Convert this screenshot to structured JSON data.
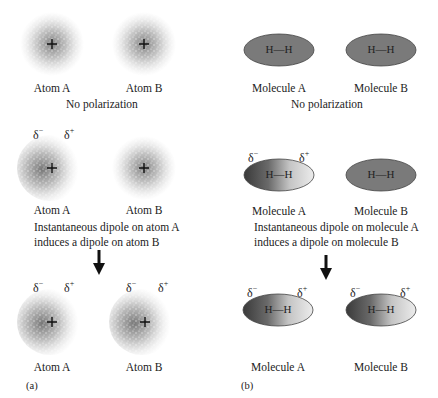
{
  "panel_a": {
    "tag": "(a)",
    "rows": [
      {
        "atoms": [
          {
            "label": "Atom A",
            "polarized": false
          },
          {
            "label": "Atom B",
            "polarized": false
          }
        ],
        "caption": "No polarization"
      },
      {
        "atoms": [
          {
            "label": "Atom A",
            "polarized": true,
            "delta_minus": "δ",
            "delta_minus_sign": "−",
            "delta_plus": "δ",
            "delta_plus_sign": "+"
          },
          {
            "label": "Atom B",
            "polarized": false
          }
        ],
        "caption_line1": "Instantaneous dipole on atom A",
        "caption_line2": "induces a dipole on atom B"
      },
      {
        "atoms": [
          {
            "label": "Atom A",
            "polarized": true,
            "delta_minus": "δ",
            "delta_minus_sign": "−",
            "delta_plus": "δ",
            "delta_plus_sign": "+"
          },
          {
            "label": "Atom B",
            "polarized": true,
            "delta_minus": "δ",
            "delta_minus_sign": "−",
            "delta_plus": "δ",
            "delta_plus_sign": "+"
          }
        ]
      }
    ],
    "nucleus_symbol": "+"
  },
  "panel_b": {
    "tag": "(b)",
    "rows": [
      {
        "molecules": [
          {
            "label": "Molecule A",
            "formula": "H—H",
            "polarized": false
          },
          {
            "label": "Molecule B",
            "formula": "H—H",
            "polarized": false
          }
        ],
        "caption": "No polarization"
      },
      {
        "molecules": [
          {
            "label": "Molecule A",
            "formula": "H—H",
            "polarized": true,
            "delta_minus": "δ",
            "delta_minus_sign": "−",
            "delta_plus": "δ",
            "delta_plus_sign": "+"
          },
          {
            "label": "Molecule B",
            "formula": "H—H",
            "polarized": false
          }
        ],
        "caption_line1": "Instantaneous dipole on molecule A",
        "caption_line2": "induces a dipole on molecule B"
      },
      {
        "molecules": [
          {
            "label": "Molecule A",
            "formula": "H—H",
            "polarized": true,
            "delta_minus": "δ",
            "delta_minus_sign": "−",
            "delta_plus": "δ",
            "delta_plus_sign": "+"
          },
          {
            "label": "Molecule B",
            "formula": "H—H",
            "polarized": true,
            "delta_minus": "δ",
            "delta_minus_sign": "−",
            "delta_plus": "δ",
            "delta_plus_sign": "+"
          }
        ]
      }
    ]
  },
  "colors": {
    "cloud": "#555555",
    "ellipse_uniform": "#7a7a7a",
    "ellipse_dark": "#3a3a3a",
    "ellipse_light": "#e8e8e8",
    "arrow": "#111111"
  }
}
